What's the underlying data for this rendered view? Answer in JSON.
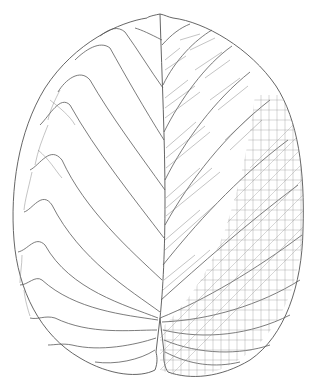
{
  "illustration": {
    "subject": "leaf venation drawing",
    "style": "pen line drawing",
    "colors": {
      "background": "#ffffff",
      "line": "#555555",
      "fine_line": "#8a8a8a"
    },
    "regions": [
      {
        "name": "left-half",
        "detail": "primary and secondary veins only"
      },
      {
        "name": "right-inner",
        "detail": "tertiary ladder-like veins"
      },
      {
        "name": "right-outer",
        "detail": "dense reticulate network"
      }
    ]
  }
}
